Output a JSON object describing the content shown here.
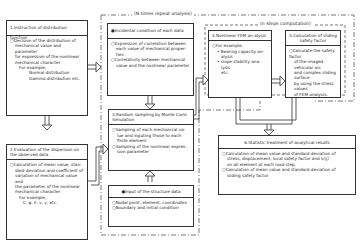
{
  "frames": {
    "outer_label": "(N times repeat analysis)",
    "inner_label": "(n steps computation)"
  },
  "box1": {
    "title": "1.Instruction of distribution function",
    "lines": [
      "○Decision of the distribution of",
      "mechanical value and parameter",
      "for expression of the nonlinear",
      "mechanical character",
      "For example,",
      "Normal distribution",
      "Gamma distribution etc."
    ]
  },
  "box2": {
    "title": "2.Evaluation of the dispersion on the observed data",
    "lines": [
      "○Calculation of mean value, stan-",
      "dard deviation and coefficient of",
      "variation of mechanical value and",
      "the parameter of the nonlinear",
      "mechanical character",
      "For example,",
      "C, φ, E, ν, γ, etc."
    ]
  },
  "box_incidental": {
    "title": "●Incidental condition of each data",
    "lines": [
      "○Expression of correlation between",
      "each value of mechanical proper-",
      "ties",
      "○Correlativity between mechanical",
      "value and the nonlinear parameter"
    ]
  },
  "box3": {
    "title": "3.Random sampling by Monte Carlo Simulation",
    "lines": [
      "○Sampling of each mechanical va-",
      "lue and inputing those to each",
      "finite element",
      "○Sampling of the nonlinear expres-",
      "sion parameter"
    ]
  },
  "box_input": {
    "title": "●Input of the structure data",
    "lines": [
      "○Nodal point, element, coordinates",
      "○Boundary and initial condition"
    ]
  },
  "box4": {
    "title": "4.Nonlinear FEM an-alysis",
    "lines": [
      "○For example,",
      "• Bearing capacity an-",
      "alysis",
      "• slope stability ana-",
      "lysis",
      "etc."
    ]
  },
  "box5": {
    "title": "5.Calculation of sliding safety factor",
    "lines": [
      "○Calculate the safety factor",
      "of the imaged vehicular arc",
      "and complex sliding surface",
      "by using the stress values",
      "of FEM analysis."
    ]
  },
  "box6": {
    "title": "6.Statistic treatment of analytical results",
    "lines": [
      "○Calculation of mean value and standard deviation of",
      "stress, displacement, local safety factor and s(ij)",
      "on all element at each load step.",
      "○Calculation of mean value and standard deviation of",
      "sliding safety factor"
    ]
  },
  "colors": {
    "line": "#333333",
    "text": "#2a2a2a",
    "background": "#ffffff"
  }
}
